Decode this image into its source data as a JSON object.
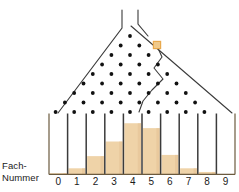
{
  "diagram": {
    "name": "galton-board",
    "axis_label_line1": "Fach-",
    "axis_label_line2": "Nummer",
    "bin_numbers": [
      "0",
      "1",
      "2",
      "3",
      "4",
      "5",
      "6",
      "7",
      "8",
      "9"
    ],
    "colors": {
      "ball": "#E8A94E",
      "ball_fill": "#F0C98A",
      "bar_fill": "#EFD3A8",
      "bar_shade": "#E4C193",
      "line": "#3B3B3B",
      "pin": "#111111",
      "background": "#FFFFFF",
      "text": "#1A1A1A"
    },
    "ball": {
      "label": "falling-ball",
      "x": 157,
      "y": 45
    },
    "funnel": {
      "left_wall_x": 122,
      "right_wall_x": 138,
      "top_y": 10
    },
    "pins": {
      "rows": 9,
      "row_counts": [
        1,
        2,
        3,
        4,
        5,
        6,
        7,
        8,
        9
      ],
      "top_y": 36,
      "row_spacing": 10.5,
      "col_spacing": 18.6
    },
    "path": {
      "label": "ball-trajectory",
      "description": "zigzag path of the ball bouncing down the right side of the pin array"
    }
  },
  "chart_data": {
    "type": "bar",
    "xlabel": "Fach-Nummer",
    "ylabel": "",
    "categories": [
      "0",
      "1",
      "2",
      "3",
      "4",
      "5",
      "6",
      "7",
      "8",
      "9"
    ],
    "values": [
      1,
      5,
      15,
      27,
      42,
      38,
      16,
      5,
      2,
      0
    ],
    "ylim": [
      0,
      50
    ],
    "grid": false,
    "legend": false,
    "bar_color": "#EFD3A8"
  }
}
